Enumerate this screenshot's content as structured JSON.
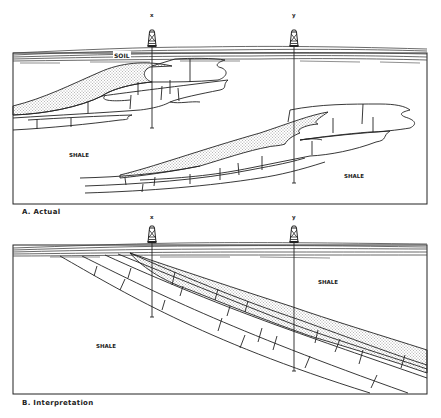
{
  "panels": [
    {
      "id": "A",
      "caption": "A.  Actual",
      "wells": [
        {
          "label": "x"
        },
        {
          "label": "y"
        }
      ],
      "labels": {
        "soil": "SOIL",
        "shale_left": "SHALE",
        "shale_right": "SHALE"
      }
    },
    {
      "id": "B",
      "caption": "B.  Interpretation",
      "wells": [
        {
          "label": "x"
        },
        {
          "label": "y"
        }
      ],
      "labels": {
        "shale_right": "SHALE",
        "shale_left": "SHALE"
      }
    }
  ],
  "colors": {
    "line": "#222222",
    "background": "#ffffff",
    "sand_dots": "#333333"
  }
}
